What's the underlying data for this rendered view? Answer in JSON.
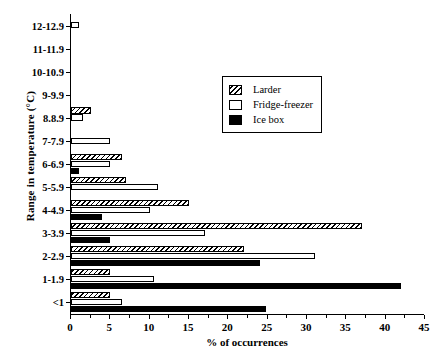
{
  "chart_data": {
    "type": "bar",
    "orientation": "horizontal",
    "title": "",
    "xlabel": "% of occurrences",
    "ylabel": "Range in temperature (°C)",
    "xlim": [
      0,
      45
    ],
    "xticks": [
      0,
      5,
      10,
      15,
      20,
      25,
      30,
      35,
      40,
      45
    ],
    "xtick_labels": [
      "0",
      "5",
      "10",
      "15",
      "20",
      "25",
      "30",
      "35",
      "40",
      "45"
    ],
    "grid": false,
    "legend_position": "upper right",
    "categories": [
      "12-12.9",
      "11-11.9",
      "10-10.9",
      "9-9.9",
      "8.8.9",
      "7-7.9",
      "6-6.9",
      "5-5.9",
      "4-4.9",
      "3-3.9",
      "2-2.9",
      "1-1.9",
      "<1"
    ],
    "series": [
      {
        "name": "Larder",
        "fill": "hatched",
        "values": [
          0,
          0,
          0,
          0,
          2.5,
          0,
          6.5,
          7,
          15,
          37,
          22,
          5,
          5
        ]
      },
      {
        "name": "Fridge-freezer",
        "fill": "white",
        "values": [
          1,
          0,
          0,
          0,
          1.5,
          5,
          5,
          11,
          10,
          17,
          31,
          10.5,
          6.5
        ]
      },
      {
        "name": "Ice box",
        "fill": "black",
        "values": [
          0,
          0,
          0,
          0,
          0,
          0,
          1,
          0,
          4,
          5,
          24,
          42,
          24.8
        ]
      }
    ]
  },
  "legend": {
    "items": [
      {
        "label": "Larder",
        "swatch": "hatched-swatch"
      },
      {
        "label": "Fridge-freezer",
        "swatch": "white-swatch"
      },
      {
        "label": "Ice box",
        "swatch": "black-swatch"
      }
    ]
  }
}
